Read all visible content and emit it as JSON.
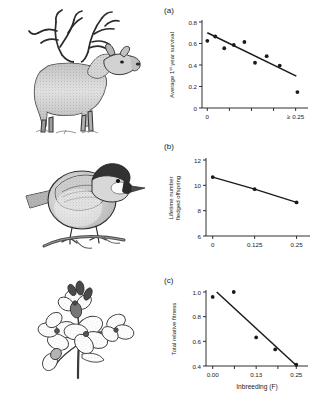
{
  "figure": {
    "title": "",
    "background_color": "#ffffff",
    "ink_color": "#1a1a1a"
  },
  "panels": [
    {
      "tag": "(a)",
      "organism_icon": "red-deer-stag-illustration",
      "organism_name": "Red deer stag"
    },
    {
      "tag": "(b)",
      "organism_icon": "chickadee-bird-illustration",
      "organism_name": "Great tit"
    },
    {
      "tag": "(c)",
      "organism_icon": "flowering-plant-illustration",
      "organism_name": "Flowering plant"
    }
  ],
  "chart_data": [
    {
      "type": "scatter",
      "panel": "(a)",
      "title": "",
      "xlabel": "",
      "ylabel": "Average 1st year survival",
      "ylabel_parts": {
        "pre": "Average 1",
        "sup": "st",
        "post": " year survival"
      },
      "xlim": [
        -0.015,
        0.285
      ],
      "ylim": [
        0,
        0.8
      ],
      "xticks": [
        0,
        0.0625,
        0.125,
        0.1875,
        0.25
      ],
      "xticklabels": [
        "0",
        "",
        "",
        "",
        "≥ 0.25"
      ],
      "yticks": [
        0,
        0.2,
        0.4,
        0.6,
        0.8
      ],
      "yticklabels": [
        "0",
        "0.2",
        "0.4",
        "0.6",
        "0.8"
      ],
      "grid": false,
      "legend": "none",
      "points": [
        {
          "x": 0.0,
          "y": 0.625
        },
        {
          "x": 0.0225,
          "y": 0.665
        },
        {
          "x": 0.048,
          "y": 0.556
        },
        {
          "x": 0.075,
          "y": 0.586
        },
        {
          "x": 0.105,
          "y": 0.614
        },
        {
          "x": 0.135,
          "y": 0.421
        },
        {
          "x": 0.168,
          "y": 0.482
        },
        {
          "x": 0.205,
          "y": 0.395
        },
        {
          "x": 0.255,
          "y": 0.148
        }
      ],
      "trendline": {
        "x": [
          0.0,
          0.252
        ],
        "y": [
          0.7,
          0.296
        ]
      }
    },
    {
      "type": "line",
      "panel": "(b)",
      "title": "",
      "xlabel": "",
      "ylabel": "Lifetime number fledged offspring",
      "ylabel_lines": [
        "Lifetime number",
        "fledged offspring"
      ],
      "xlim": [
        -0.02,
        0.29
      ],
      "ylim": [
        6,
        12
      ],
      "xticks": [
        0,
        0.125,
        0.25
      ],
      "xticklabels": [
        "0",
        "0.125",
        "0.25"
      ],
      "yticks": [
        6,
        8,
        10,
        12
      ],
      "yticklabels": [
        "6",
        "8",
        "10",
        "12"
      ],
      "grid": false,
      "legend": "none",
      "points": [
        {
          "x": 0.0,
          "y": 10.65
        },
        {
          "x": 0.125,
          "y": 9.7
        },
        {
          "x": 0.25,
          "y": 8.65
        }
      ]
    },
    {
      "type": "scatter",
      "panel": "(c)",
      "title": "",
      "xlabel": "Inbreeding (F)",
      "ylabel": "Total relative fitness",
      "xlim": [
        -0.02,
        0.285
      ],
      "ylim": [
        0.4,
        1.0
      ],
      "xticks": [
        0.0,
        0.065,
        0.13,
        0.195,
        0.25
      ],
      "xticklabels": [
        "0.00",
        "",
        "0.13",
        "",
        "0.25"
      ],
      "yticks": [
        0.4,
        0.6,
        0.8,
        1.0
      ],
      "yticklabels": [
        "0.4",
        "0.6",
        "0.8",
        "1.0"
      ],
      "grid": false,
      "legend": "none",
      "points": [
        {
          "x": 0.0,
          "y": 0.96
        },
        {
          "x": 0.063,
          "y": 1.0
        },
        {
          "x": 0.13,
          "y": 0.632
        },
        {
          "x": 0.187,
          "y": 0.534
        },
        {
          "x": 0.25,
          "y": 0.41
        }
      ],
      "trendline": {
        "x": [
          0.012,
          0.252
        ],
        "y": [
          1.0,
          0.4
        ]
      }
    }
  ]
}
